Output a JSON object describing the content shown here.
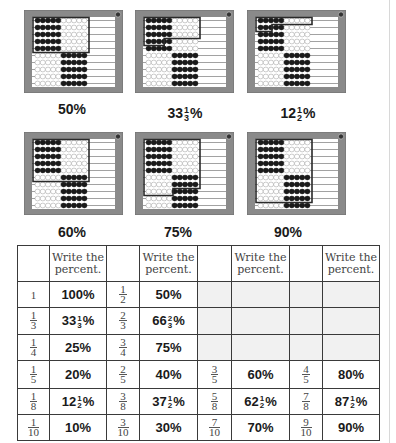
{
  "abaci": [
    {
      "id": "a50",
      "label_whole": "50%",
      "label_frac": null,
      "x": 24,
      "y": 10,
      "highlight": {
        "full_rows": 5,
        "partial_beads": 0
      }
    },
    {
      "id": "a33",
      "label_whole": "33",
      "label_frac": {
        "n": "1",
        "d": "3"
      },
      "x": 135,
      "y": 10,
      "highlight": {
        "full_rows": 3,
        "partial_beads": 3.3
      }
    },
    {
      "id": "a12",
      "label_whole": "12",
      "label_frac": {
        "n": "1",
        "d": "2"
      },
      "x": 247,
      "y": 10,
      "highlight": {
        "full_rows": 1,
        "partial_beads": 2.5
      }
    },
    {
      "id": "a60",
      "label_whole": "60%",
      "label_frac": null,
      "x": 24,
      "y": 132,
      "highlight": {
        "full_rows": 6,
        "partial_beads": 0
      }
    },
    {
      "id": "a75",
      "label_whole": "75%",
      "label_frac": null,
      "x": 135,
      "y": 132,
      "highlight": {
        "full_rows": 7,
        "partial_beads": 5
      }
    },
    {
      "id": "a90",
      "label_whole": "90%",
      "label_frac": null,
      "x": 247,
      "y": 132,
      "highlight": {
        "full_rows": 9,
        "partial_beads": 0
      }
    }
  ],
  "captions": {
    "c50": "50%",
    "c33_whole": "33",
    "c33_n": "1",
    "c33_d": "3",
    "c33_pct": "%",
    "c12_whole": "12",
    "c12_n": "1",
    "c12_d": "2",
    "c12_pct": "%",
    "c60": "60%",
    "c75": "75%",
    "c90": "90%"
  },
  "colors": {
    "frame": "#8a8a8a",
    "frame_dark": "#6f6f6f",
    "bead_black": "#1a1a1a",
    "bead_white": "#ffffff",
    "wire": "#7a7a7a",
    "highlight": "#2a2a2a"
  },
  "table": {
    "header": "Write the percent.",
    "header_l1": "Write the",
    "header_l2": "percent.",
    "rows": [
      {
        "f1": {
          "n": "1",
          "d": ""
        },
        "p1": {
          "w": "100%"
        },
        "f2": {
          "n": "1",
          "d": "2"
        },
        "p2": {
          "w": "50%"
        },
        "f3": null,
        "p3": null,
        "f4": null,
        "p4": null
      },
      {
        "f1": {
          "n": "1",
          "d": "3"
        },
        "p1": {
          "w": "33",
          "fn": "1",
          "fd": "3",
          "s": "%"
        },
        "f2": {
          "n": "2",
          "d": "3"
        },
        "p2": {
          "w": "66",
          "fn": "2",
          "fd": "3",
          "s": "%"
        },
        "f3": null,
        "p3": null,
        "f4": null,
        "p4": null
      },
      {
        "f1": {
          "n": "1",
          "d": "4"
        },
        "p1": {
          "w": "25%"
        },
        "f2": {
          "n": "3",
          "d": "4"
        },
        "p2": {
          "w": "75%"
        },
        "f3": null,
        "p3": null,
        "f4": null,
        "p4": null
      },
      {
        "f1": {
          "n": "1",
          "d": "5"
        },
        "p1": {
          "w": "20%"
        },
        "f2": {
          "n": "2",
          "d": "5"
        },
        "p2": {
          "w": "40%"
        },
        "f3": {
          "n": "3",
          "d": "5"
        },
        "p3": {
          "w": "60%"
        },
        "f4": {
          "n": "4",
          "d": "5"
        },
        "p4": {
          "w": "80%"
        }
      },
      {
        "f1": {
          "n": "1",
          "d": "8"
        },
        "p1": {
          "w": "12",
          "fn": "1",
          "fd": "2",
          "s": "%"
        },
        "f2": {
          "n": "3",
          "d": "8"
        },
        "p2": {
          "w": "37",
          "fn": "1",
          "fd": "2",
          "s": "%"
        },
        "f3": {
          "n": "5",
          "d": "8"
        },
        "p3": {
          "w": "62",
          "fn": "1",
          "fd": "2",
          "s": "%"
        },
        "f4": {
          "n": "7",
          "d": "8"
        },
        "p4": {
          "w": "87",
          "fn": "1",
          "fd": "2",
          "s": "%"
        }
      },
      {
        "f1": {
          "n": "1",
          "d": "10"
        },
        "p1": {
          "w": "10%"
        },
        "f2": {
          "n": "3",
          "d": "10"
        },
        "p2": {
          "w": "30%"
        },
        "f3": {
          "n": "7",
          "d": "10"
        },
        "p3": {
          "w": "70%"
        },
        "f4": {
          "n": "9",
          "d": "10"
        },
        "p4": {
          "w": "90%"
        }
      }
    ]
  }
}
